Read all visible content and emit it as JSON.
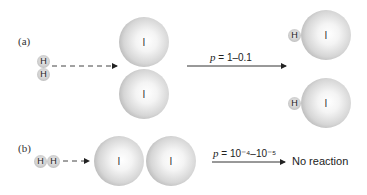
{
  "panel_a": {
    "label": "(a)",
    "reactant_h_atoms": [
      "H",
      "H"
    ],
    "reactant_i_atoms": [
      "I",
      "I"
    ],
    "probability_symbol": "p",
    "probability_text": "= 1–0.1",
    "products": [
      {
        "h": "H",
        "i": "I"
      },
      {
        "h": "H",
        "i": "I"
      }
    ]
  },
  "panel_b": {
    "label": "(b)",
    "reactant_h_atoms": [
      "H",
      "H"
    ],
    "reactant_i_atoms": [
      "I",
      "I"
    ],
    "probability_symbol": "p",
    "probability_text": "= 10⁻⁴–10⁻⁵",
    "result": "No reaction"
  }
}
